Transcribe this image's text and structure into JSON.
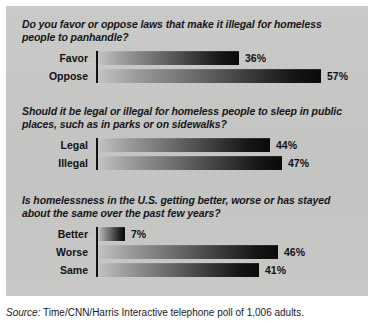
{
  "source": {
    "label": "Source:",
    "text": " Time/CNN/Harris Interactive telephone poll of 1,006 adults."
  },
  "chart_data": {
    "type": "bar",
    "title": "",
    "orientation": "horizontal",
    "xlabel": "",
    "ylabel": "",
    "xlim": [
      0,
      100
    ],
    "grid": false,
    "legend": false,
    "unit": "%",
    "panels": [
      {
        "question": "Do you favor or oppose laws that make it illegal for homeless people to panhandle?",
        "categories": [
          "Favor",
          "Oppose"
        ],
        "values": [
          36,
          57
        ],
        "labels": [
          "36%",
          "57%"
        ]
      },
      {
        "question": "Should it be legal or illegal for homeless people to sleep in public places, such as in parks or on sidewalks?",
        "categories": [
          "Legal",
          "Illegal"
        ],
        "values": [
          44,
          47
        ],
        "labels": [
          "44%",
          "47%"
        ]
      },
      {
        "question": "Is homelessness in the U.S. getting better, worse or has stayed about the same over the past few years?",
        "categories": [
          "Better",
          "Worse",
          "Same"
        ],
        "values": [
          7,
          46,
          41
        ],
        "labels": [
          "7%",
          "46%",
          "41%"
        ]
      }
    ]
  },
  "colors": {
    "panel_background": "#c8c8c6",
    "page_background": "#ffffff",
    "bar_dark": "#0a0a0a",
    "bar_light": "#c2c2c0",
    "text": "#111114"
  }
}
